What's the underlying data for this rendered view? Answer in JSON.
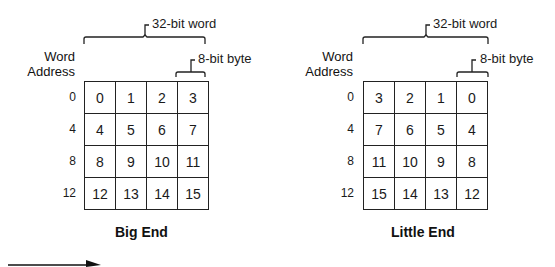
{
  "diagrams": [
    {
      "id": "big",
      "title": "Big End",
      "word_label": "32-bit word",
      "byte_label": "8-bit byte",
      "address_header": [
        "Word",
        "Address"
      ],
      "addresses": [
        "0",
        "4",
        "8",
        "12"
      ],
      "rows": [
        [
          "0",
          "1",
          "2",
          "3"
        ],
        [
          "4",
          "5",
          "6",
          "7"
        ],
        [
          "8",
          "9",
          "10",
          "11"
        ],
        [
          "12",
          "13",
          "14",
          "15"
        ]
      ]
    },
    {
      "id": "little",
      "title": "Little End",
      "word_label": "32-bit word",
      "byte_label": "8-bit byte",
      "address_header": [
        "Word",
        "Address"
      ],
      "addresses": [
        "0",
        "4",
        "8",
        "12"
      ],
      "rows": [
        [
          "3",
          "2",
          "1",
          "0"
        ],
        [
          "7",
          "6",
          "5",
          "4"
        ],
        [
          "11",
          "10",
          "9",
          "8"
        ],
        [
          "15",
          "14",
          "13",
          "12"
        ]
      ]
    }
  ],
  "arrow": {
    "direction": "right"
  }
}
